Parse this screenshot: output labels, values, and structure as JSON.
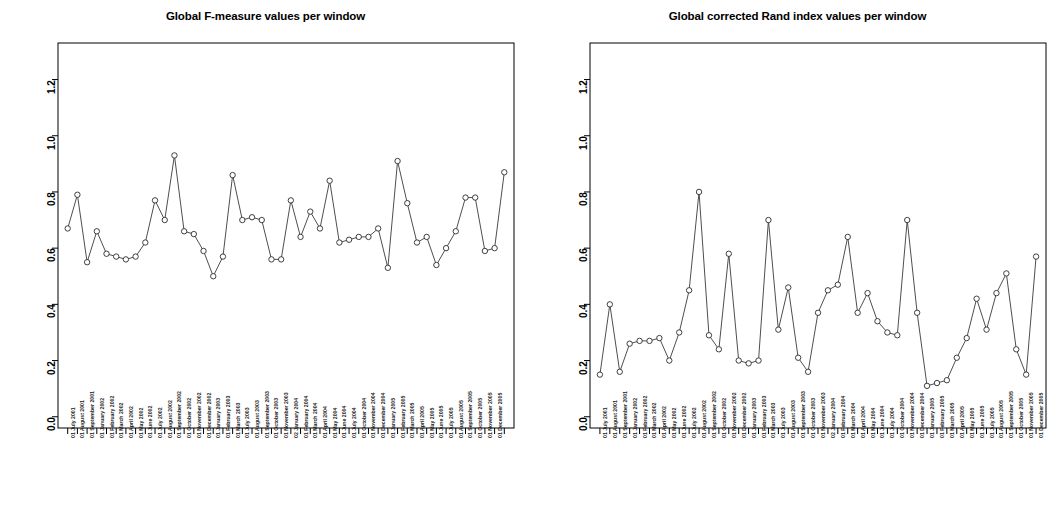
{
  "page": {
    "background": "#ffffff",
    "width": 1063,
    "height": 528
  },
  "panels": [
    {
      "id": "f-measure",
      "title": "Global F-measure values per window"
    },
    {
      "id": "rand-index",
      "title": "Global corrected Rand index values per window"
    }
  ],
  "axis": {
    "y_ticks": [
      "0.0",
      "0.2",
      "0.4",
      "0.6",
      "0.8",
      "1.0",
      "1.2"
    ],
    "y_tick_values": [
      0.0,
      0.2,
      0.4,
      0.6,
      0.8,
      1.0,
      1.2
    ],
    "ylim": [
      -0.04,
      1.33
    ],
    "grid": false,
    "axis_color": "#000000"
  },
  "x_categories": [
    "01 July 2001",
    "01 August 2001",
    "01 September 2001",
    "01 January 2002",
    "01 February 2002",
    "01 March 2002",
    "01 April 2002",
    "01 May 2002",
    "01 June 2002",
    "01 July 2002",
    "01 August 2002",
    "01 September 2002",
    "01 October 2002",
    "01 November 2002",
    "01 December 2002",
    "01 January 2003",
    "01 February 2003",
    "01 March 2003",
    "01 July 2003",
    "01 August 2003",
    "01 September 2003",
    "01 October 2003",
    "01 November 2003",
    "02 January 2004",
    "01 February 2004",
    "01 March 2004",
    "01 April 2004",
    "01 May 2004",
    "01 June 2004",
    "01 July 2004",
    "01 October 2004",
    "01 November 2004",
    "01 December 2004",
    "01 January 2005",
    "01 February 2005",
    "01 March 2005",
    "01 April 2005",
    "01 May 2005",
    "01 June 2005",
    "01 July 2005",
    "01 August 2005",
    "01 September 2005",
    "01 October 2005",
    "01 November 2005",
    "01 December 2005"
  ],
  "chart_data": [
    {
      "type": "line",
      "title": "Global F-measure values per window",
      "xlabel": "",
      "ylabel": "",
      "ylim": [
        0.0,
        1.3
      ],
      "grid": false,
      "marker": "open-circle",
      "categories": [
        "01 July 2001",
        "01 August 2001",
        "01 September 2001",
        "01 January 2002",
        "01 February 2002",
        "01 March 2002",
        "01 April 2002",
        "01 May 2002",
        "01 June 2002",
        "01 July 2002",
        "01 August 2002",
        "01 September 2002",
        "01 October 2002",
        "01 November 2002",
        "01 December 2002",
        "01 January 2003",
        "01 February 2003",
        "01 March 2003",
        "01 July 2003",
        "01 August 2003",
        "01 September 2003",
        "01 October 2003",
        "01 November 2003",
        "02 January 2004",
        "01 February 2004",
        "01 March 2004",
        "01 April 2004",
        "01 May 2004",
        "01 June 2004",
        "01 July 2004",
        "01 October 2004",
        "01 November 2004",
        "01 December 2004",
        "01 January 2005",
        "01 February 2005",
        "01 March 2005",
        "01 April 2005",
        "01 May 2005",
        "01 June 2005",
        "01 July 2005",
        "01 August 2005",
        "01 September 2005",
        "01 October 2005",
        "01 November 2005",
        "01 December 2005"
      ],
      "values": [
        0.67,
        0.79,
        0.55,
        0.66,
        0.58,
        0.57,
        0.56,
        0.57,
        0.62,
        0.77,
        0.7,
        0.93,
        0.66,
        0.65,
        0.59,
        0.5,
        0.57,
        0.86,
        0.7,
        0.71,
        0.7,
        0.56,
        0.56,
        0.77,
        0.64,
        0.73,
        0.67,
        0.84,
        0.62,
        0.63,
        0.64,
        0.64,
        0.67,
        0.53,
        0.91,
        0.76,
        0.62,
        0.64,
        0.54,
        0.6,
        0.66,
        0.78,
        0.78,
        0.59,
        0.6,
        0.87
      ]
    },
    {
      "type": "line",
      "title": "Global corrected Rand index values per window",
      "xlabel": "",
      "ylabel": "",
      "ylim": [
        0.0,
        1.3
      ],
      "grid": false,
      "marker": "open-circle",
      "categories": [
        "01 July 2001",
        "01 August 2001",
        "01 September 2001",
        "01 January 2002",
        "01 February 2002",
        "01 March 2002",
        "01 April 2002",
        "01 May 2002",
        "01 June 2002",
        "01 July 2002",
        "01 August 2002",
        "01 September 2002",
        "01 October 2002",
        "01 November 2002",
        "01 December 2002",
        "01 January 2003",
        "01 February 2003",
        "01 March 2003",
        "01 July 2003",
        "01 August 2003",
        "01 September 2003",
        "01 October 2003",
        "01 November 2003",
        "02 January 2004",
        "01 February 2004",
        "01 March 2004",
        "01 April 2004",
        "01 May 2004",
        "01 June 2004",
        "01 July 2004",
        "01 October 2004",
        "01 November 2004",
        "01 December 2004",
        "01 January 2005",
        "01 February 2005",
        "01 March 2005",
        "01 April 2005",
        "01 May 2005",
        "01 June 2005",
        "01 July 2005",
        "01 August 2005",
        "01 September 2005",
        "01 October 2005",
        "01 November 2005",
        "01 December 2005"
      ],
      "values": [
        0.15,
        0.4,
        0.16,
        0.26,
        0.27,
        0.27,
        0.28,
        0.2,
        0.3,
        0.45,
        0.8,
        0.29,
        0.24,
        0.58,
        0.2,
        0.19,
        0.2,
        0.7,
        0.31,
        0.46,
        0.21,
        0.16,
        0.37,
        0.45,
        0.47,
        0.64,
        0.37,
        0.44,
        0.34,
        0.3,
        0.29,
        0.7,
        0.37,
        0.11,
        0.12,
        0.13,
        0.21,
        0.28,
        0.42,
        0.31,
        0.44,
        0.51,
        0.24,
        0.15,
        0.57
      ]
    }
  ]
}
